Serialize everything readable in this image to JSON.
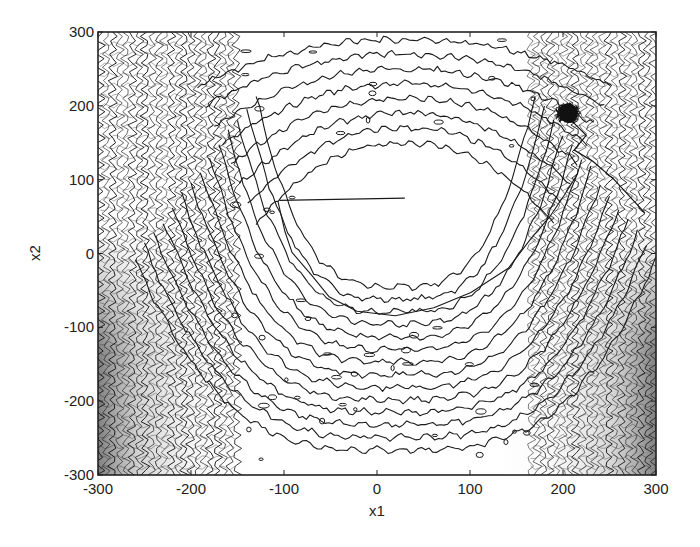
{
  "chart_data": {
    "type": "contour",
    "title": "",
    "xlabel": "x1",
    "ylabel": "x2",
    "xlim": [
      -300,
      300
    ],
    "ylim": [
      -300,
      300
    ],
    "xticks": [
      -300,
      -200,
      -100,
      0,
      100,
      200,
      300
    ],
    "yticks": [
      -300,
      -200,
      -100,
      0,
      100,
      200,
      300
    ],
    "xtick_labels": [
      "-300",
      "-200",
      "-100",
      "0",
      "100",
      "200",
      "300"
    ],
    "ytick_labels": [
      "-300",
      "-200",
      "-100",
      "0",
      "100",
      "200",
      "300"
    ],
    "grid": false,
    "legend": null,
    "colormap": "grayscale (black contour lines, dense gray shading near x1=±250..300)",
    "surface_description": "U-shaped valley with minimum basin around x1≈0..50, x2≈0..100; dense oscillatory ripples for |x1|>150; horizontal banded contours above and below the basin",
    "contour_levels_visible": 14,
    "basin_center": [
      30,
      60
    ],
    "trajectory": {
      "description": "search path of sampled points converging to a dense cluster",
      "cluster_center": [
        205,
        190
      ],
      "cluster_radius": 15,
      "path_points": [
        [
          288,
          55
        ],
        [
          255,
          100
        ],
        [
          232,
          125
        ],
        [
          212,
          140
        ],
        [
          225,
          160
        ],
        [
          205,
          185
        ]
      ]
    }
  },
  "axes": {
    "x_label": "x1",
    "y_label": "x2"
  },
  "colors": {
    "line": "#1a1a1a",
    "shade_dark": "#6e6e6e",
    "shade_light": "#d8d8d8",
    "background": "#ffffff"
  }
}
